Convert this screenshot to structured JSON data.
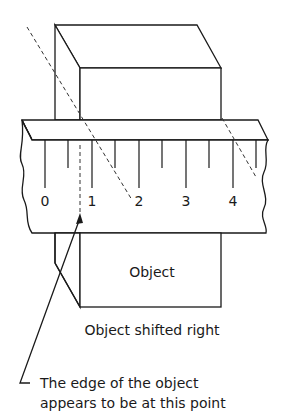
{
  "figure": {
    "ruler_scale": {
      "labels": [
        "0",
        "1",
        "2",
        "3",
        "4"
      ],
      "major_tick_x": [
        45,
        92,
        139,
        186,
        233
      ],
      "minor_tick_x": [
        68,
        115,
        162,
        209,
        256
      ]
    },
    "object_label": "Object",
    "caption": "Object shifted right",
    "annotation": {
      "line1": "The edge of the object",
      "line2": "appears to be at this point"
    }
  }
}
